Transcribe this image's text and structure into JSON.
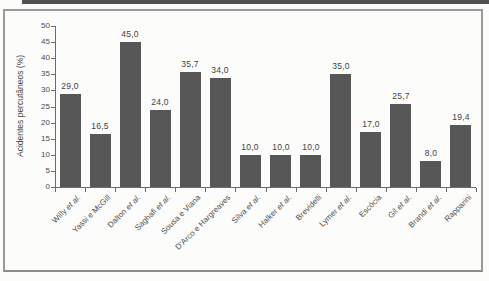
{
  "chart_data": {
    "type": "bar",
    "title": "",
    "xlabel": "",
    "ylabel": "Acidentes percutâneos (%)",
    "ylim": [
      0,
      50
    ],
    "yticks": [
      0,
      5,
      10,
      15,
      20,
      25,
      30,
      35,
      40,
      45,
      50
    ],
    "grid": false,
    "legend": null,
    "categories": [
      "Willy et al.",
      "Yassi e McGill",
      "Dalton et al.",
      "Saghafi et al.",
      "Sousa e Viana",
      "D'Arco e Hargreaves",
      "Silva et al.",
      "Halker et al.",
      "Brevidelli",
      "Lymer et al.",
      "Escócia",
      "Gil et al.",
      "Brandi et al.",
      "Rapparini"
    ],
    "values": [
      29.0,
      16.5,
      45.0,
      24.0,
      35.7,
      34.0,
      10.0,
      10.0,
      10.0,
      35.0,
      17.0,
      25.7,
      8.0,
      19.4
    ],
    "value_labels": [
      "29,0",
      "16,5",
      "45,0",
      "24,0",
      "35,7",
      "34,0",
      "10,0",
      "10,0",
      "10,0",
      "35,0",
      "17,0",
      "25,7",
      "8,0",
      "19,4"
    ],
    "colors": {
      "bar": "#575757",
      "axis": "#6b6b6b",
      "text": "#4a4a4a",
      "frame_border": "#9a9a9a",
      "scan_strip": "#525252"
    }
  }
}
